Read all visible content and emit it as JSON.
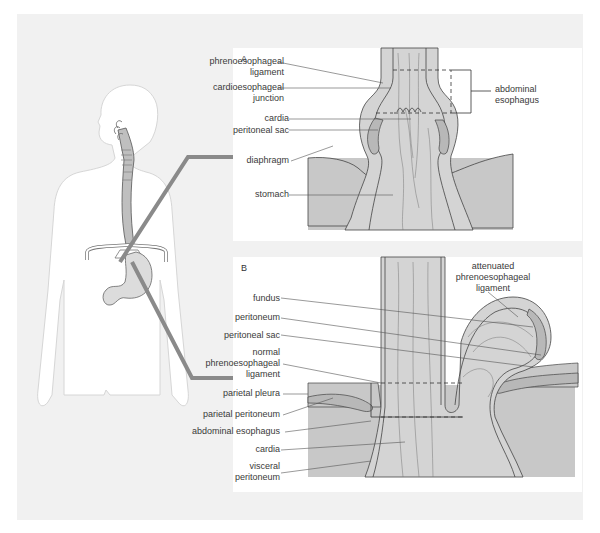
{
  "figure": {
    "colors": {
      "background": "#ffffff",
      "outer_panel": "#f1f1f1",
      "body_outline": "#d0d0d0",
      "tissue_fill": "#c8c8c8",
      "tissue_light": "#d9d9d9",
      "arrow": "#8a8a8a",
      "line": "#555555"
    }
  },
  "panel_a": {
    "letter": "A",
    "labels": {
      "phrenoesophageal_ligament": [
        "phrenoesophageal",
        "ligament"
      ],
      "cardioesophageal_junction": [
        "cardioesophageal",
        "junction"
      ],
      "cardia": "cardia",
      "peritoneal_sac": "peritoneal sac",
      "diaphragm": "diaphragm",
      "stomach": "stomach",
      "abdominal_esophagus": [
        "abdominal",
        "esophagus"
      ]
    }
  },
  "panel_b": {
    "letter": "B",
    "labels": {
      "attenuated_ligament": [
        "attenuated",
        "phrenoesophageal",
        "ligament"
      ],
      "fundus": "fundus",
      "peritoneum": "peritoneum",
      "peritoneal_sac": "peritoneal sac",
      "normal_ligament": [
        "normal",
        "phrenoesophageal",
        "ligament"
      ],
      "parietal_pleura": "parietal pleura",
      "parietal_peritoneum": "parietal peritoneum",
      "abdominal_esophagus": "abdominal esophagus",
      "cardia": "cardia",
      "visceral_peritoneum": [
        "visceral",
        "peritoneum"
      ]
    }
  }
}
